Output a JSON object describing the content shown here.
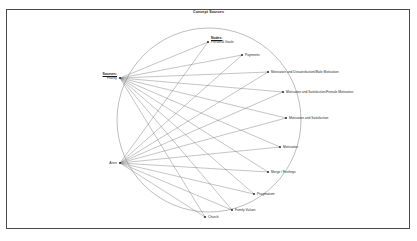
{
  "figure": {
    "title": "Concept Sources",
    "border_color": "#4a4a4a",
    "background": "#ffffff",
    "edge_color": "#6b6b6b",
    "circle_color": "#7a7a7a"
  },
  "groups": {
    "sources_heading": "Sources:",
    "nodes_heading": "Nodes:"
  },
  "chart_data": {
    "type": "diagram",
    "title": "Concept Sources",
    "layout": "circular-chord",
    "circle": {
      "cx": 209,
      "cy": 120,
      "r": 92
    },
    "source_nodes": [
      {
        "id": "franky",
        "label": "Franky",
        "x": 120,
        "y": 78,
        "side": "left"
      },
      {
        "id": "anne",
        "label": "Anne",
        "x": 120,
        "y": 163,
        "side": "left"
      }
    ],
    "concept_nodes": [
      {
        "id": "personal-goals",
        "label": "Personal Goals",
        "x": 208,
        "y": 42,
        "side": "right"
      },
      {
        "id": "payments",
        "label": "Payments",
        "x": 242,
        "y": 55,
        "side": "right"
      },
      {
        "id": "mot-dissat-male",
        "label": "Motivation and Dissatisfaction/Male Motivation",
        "x": 268,
        "y": 72,
        "side": "right"
      },
      {
        "id": "mot-sat-female",
        "label": "Motivation and Satisfaction/Female Motivation",
        "x": 283,
        "y": 92,
        "side": "right"
      },
      {
        "id": "mot-and-sat",
        "label": "Motivation and Satisfaction",
        "x": 286,
        "y": 118,
        "side": "right"
      },
      {
        "id": "motivation",
        "label": "Motivation",
        "x": 280,
        "y": 147,
        "side": "right"
      },
      {
        "id": "merge-feelings",
        "label": "Merge / Feelings",
        "x": 268,
        "y": 172,
        "side": "right"
      },
      {
        "id": "pragmatism",
        "label": "Pragmatism",
        "x": 254,
        "y": 194,
        "side": "right"
      },
      {
        "id": "family-values",
        "label": "Family Values",
        "x": 232,
        "y": 210,
        "side": "right"
      },
      {
        "id": "church",
        "label": "Church",
        "x": 205,
        "y": 217,
        "side": "right"
      }
    ],
    "edges": [
      {
        "from": "franky",
        "to": "personal-goals"
      },
      {
        "from": "franky",
        "to": "payments"
      },
      {
        "from": "franky",
        "to": "mot-dissat-male"
      },
      {
        "from": "franky",
        "to": "mot-sat-female"
      },
      {
        "from": "franky",
        "to": "mot-and-sat"
      },
      {
        "from": "franky",
        "to": "motivation"
      },
      {
        "from": "franky",
        "to": "merge-feelings"
      },
      {
        "from": "franky",
        "to": "pragmatism"
      },
      {
        "from": "franky",
        "to": "family-values"
      },
      {
        "from": "franky",
        "to": "church"
      },
      {
        "from": "anne",
        "to": "personal-goals"
      },
      {
        "from": "anne",
        "to": "payments"
      },
      {
        "from": "anne",
        "to": "mot-dissat-male"
      },
      {
        "from": "anne",
        "to": "mot-sat-female"
      },
      {
        "from": "anne",
        "to": "mot-and-sat"
      },
      {
        "from": "anne",
        "to": "motivation"
      },
      {
        "from": "anne",
        "to": "merge-feelings"
      },
      {
        "from": "anne",
        "to": "pragmatism"
      },
      {
        "from": "anne",
        "to": "family-values"
      },
      {
        "from": "anne",
        "to": "church"
      }
    ]
  }
}
